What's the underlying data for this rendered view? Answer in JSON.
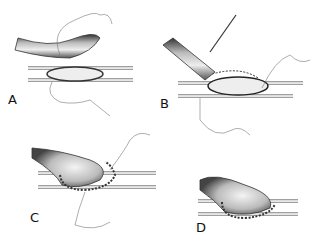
{
  "figure": {
    "panels": [
      {
        "id": "A",
        "label": "A",
        "step": "Graft end positioned over elliptical arteriotomy; suture placed at heel"
      },
      {
        "id": "B",
        "label": "B",
        "step": "Posterior wall sutured with needle holder; graft held down"
      },
      {
        "id": "C",
        "label": "C",
        "step": "Running suture continued around anastomosis"
      },
      {
        "id": "D",
        "label": "D",
        "step": "Completed anastomosis with sutures around circumference"
      }
    ]
  }
}
